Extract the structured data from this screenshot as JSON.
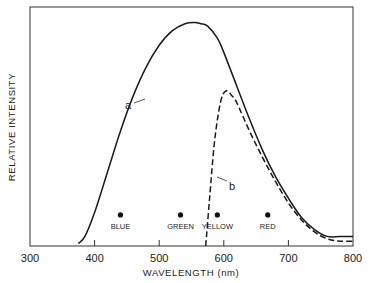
{
  "chart_data": {
    "type": "line",
    "title": "",
    "xlabel": "WAVELENGTH (nm)",
    "ylabel": "RELATIVE INTENSITY",
    "xlim": [
      300,
      800
    ],
    "ylim": [
      0,
      1
    ],
    "xticks": [
      300,
      400,
      500,
      600,
      700,
      800
    ],
    "yticks": [],
    "grid": false,
    "legend": "none (curves labeled inline)",
    "series": [
      {
        "name": "a",
        "style": "solid",
        "x": [
          375,
          385,
          400,
          420,
          440,
          460,
          480,
          500,
          520,
          540,
          555,
          565,
          575,
          590,
          600,
          620,
          640,
          660,
          680,
          700,
          720,
          740,
          760,
          780,
          800
        ],
        "y": [
          0.01,
          0.04,
          0.14,
          0.31,
          0.48,
          0.63,
          0.75,
          0.84,
          0.9,
          0.93,
          0.935,
          0.93,
          0.92,
          0.87,
          0.81,
          0.67,
          0.53,
          0.4,
          0.29,
          0.2,
          0.12,
          0.07,
          0.04,
          0.04,
          0.04
        ]
      },
      {
        "name": "b",
        "style": "dashed",
        "x": [
          572,
          578,
          585,
          592,
          598,
          605,
          612,
          620,
          640,
          660,
          680,
          700,
          720,
          740,
          760,
          780,
          800
        ],
        "y": [
          0.0,
          0.2,
          0.42,
          0.56,
          0.63,
          0.65,
          0.63,
          0.6,
          0.48,
          0.37,
          0.27,
          0.18,
          0.11,
          0.06,
          0.03,
          0.02,
          0.02
        ]
      }
    ],
    "annotations": [
      {
        "label": "BLUE",
        "x": 440,
        "y": 0.13
      },
      {
        "label": "GREEN",
        "x": 533,
        "y": 0.13
      },
      {
        "label": "YELLOW",
        "x": 590,
        "y": 0.13
      },
      {
        "label": "RED",
        "x": 668,
        "y": 0.13
      }
    ],
    "curve_labels": [
      {
        "label": "a",
        "near_x": 465
      },
      {
        "label": "b",
        "near_x": 582
      }
    ]
  }
}
